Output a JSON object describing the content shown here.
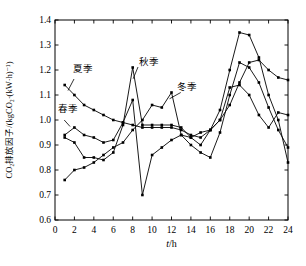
{
  "chart_data": {
    "type": "line",
    "title": "",
    "xlabel_var": "t",
    "xlabel_unit": "/h",
    "ylabel": "CO₂排放因子/(kgCO₂·(kW·h)⁻¹)",
    "xlim": [
      0,
      24
    ],
    "ylim": [
      0.6,
      1.4
    ],
    "x_ticks": [
      "0",
      "2",
      "4",
      "6",
      "8",
      "10",
      "12",
      "14",
      "16",
      "18",
      "20",
      "22",
      "24"
    ],
    "x_tick_values": [
      0,
      2,
      4,
      6,
      8,
      10,
      12,
      14,
      16,
      18,
      20,
      22,
      24
    ],
    "y_ticks": [
      "0.6",
      "0.7",
      "0.8",
      "0.9",
      "1.0",
      "1.1",
      "1.2",
      "1.3",
      "1.4"
    ],
    "y_tick_values": [
      0.6,
      0.7,
      0.8,
      0.9,
      1.0,
      1.1,
      1.2,
      1.3,
      1.4
    ],
    "grid": false,
    "legend_position": "inline-annotations",
    "line_color": "#000000",
    "marker": "square",
    "x": [
      1,
      2,
      3,
      4,
      5,
      6,
      7,
      8,
      9,
      10,
      11,
      12,
      13,
      14,
      15,
      16,
      17,
      18,
      19,
      20,
      21,
      22,
      23,
      24
    ],
    "series": [
      {
        "key": "spring",
        "name": "春季",
        "values": [
          0.94,
          0.97,
          0.94,
          0.93,
          0.91,
          0.92,
          0.99,
          1.08,
          0.7,
          0.86,
          0.89,
          0.92,
          0.94,
          0.9,
          0.87,
          0.85,
          0.95,
          1.1,
          1.23,
          1.21,
          1.15,
          1.05,
          0.96,
          0.89
        ]
      },
      {
        "key": "summer",
        "name": "夏季",
        "values": [
          1.14,
          1.1,
          1.06,
          1.04,
          1.02,
          1.0,
          0.99,
          0.98,
          0.97,
          0.97,
          0.97,
          0.97,
          0.96,
          0.94,
          0.93,
          0.96,
          1.0,
          1.13,
          1.14,
          1.1,
          1.02,
          0.97,
          1.03,
          1.02
        ]
      },
      {
        "key": "autumn",
        "name": "秋季",
        "values": [
          0.93,
          0.91,
          0.85,
          0.85,
          0.84,
          0.87,
          0.98,
          1.21,
          0.98,
          0.98,
          0.98,
          0.98,
          0.97,
          0.93,
          0.95,
          0.96,
          1.04,
          1.2,
          1.35,
          1.34,
          1.25,
          1.1,
          1.0,
          0.83
        ]
      },
      {
        "key": "winter",
        "name": "冬季",
        "values": [
          0.76,
          0.8,
          0.81,
          0.83,
          0.86,
          0.89,
          0.91,
          0.96,
          1.0,
          1.06,
          1.05,
          1.11,
          0.94,
          0.93,
          0.9,
          0.96,
          1.0,
          1.06,
          1.15,
          1.23,
          1.24,
          1.2,
          1.17,
          1.16
        ]
      }
    ],
    "annotations": [
      {
        "key": "summer",
        "label": "夏季",
        "text_x": 2.9,
        "text_y": 1.205,
        "line": [
          [
            1.96,
            1.164
          ],
          [
            1.34,
            1.118
          ]
        ]
      },
      {
        "key": "spring",
        "label": "春季",
        "text_x": 1.35,
        "text_y": 1.045,
        "line": [
          [
            0.95,
            1.0
          ],
          [
            1.55,
            0.974
          ]
        ]
      },
      {
        "key": "autumn",
        "label": "秋季",
        "text_x": 9.7,
        "text_y": 1.235,
        "line": [
          [
            8.55,
            1.212
          ],
          [
            8.05,
            1.165
          ]
        ]
      },
      {
        "key": "winter",
        "label": "冬季",
        "text_x": 13.6,
        "text_y": 1.135,
        "line": [
          [
            12.95,
            1.11
          ],
          [
            11.8,
            1.085
          ]
        ]
      }
    ]
  }
}
